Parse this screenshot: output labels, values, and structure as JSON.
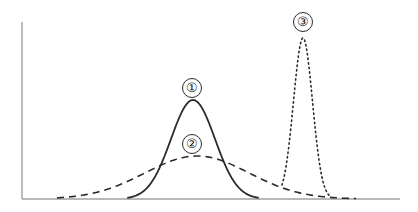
{
  "figure": {
    "name": "three-normal-distribution-curves",
    "background_color": "#ffffff",
    "axis_color": "#a0a0a0",
    "curve_color": "#2b2b2b",
    "axes": {
      "y_axis": {
        "x": 22,
        "y_top": 22,
        "y_bottom": 199
      },
      "x_axis": {
        "y": 199,
        "x_left": 22,
        "x_right": 400
      },
      "x_tick_labels": [],
      "y_tick_labels": [],
      "grid": false
    },
    "labels": [
      {
        "id": "1",
        "text": "①",
        "glyph": "1",
        "cx": 192,
        "cy": 88
      },
      {
        "id": "2",
        "text": "②",
        "glyph": "2",
        "cx": 192,
        "cy": 144
      },
      {
        "id": "3",
        "text": "③",
        "glyph": "3",
        "cx": 303,
        "cy": 22
      }
    ]
  },
  "chart_data": {
    "type": "line",
    "title": "",
    "subtitle": "",
    "xlabel": "",
    "ylabel": "",
    "xlim": [
      22,
      400
    ],
    "ylim": [
      0,
      1
    ],
    "grid": false,
    "legend_position": "inline-annotations",
    "x_tick_labels": [],
    "y_tick_labels": [],
    "series": [
      {
        "name": "1",
        "label": "①",
        "line_style": "solid",
        "color": "#2b2b2b",
        "line_width": 1.8,
        "distribution": "normal",
        "mean_px": 193,
        "sigma_px": 22,
        "peak_px": {
          "x": 193,
          "y": 100
        },
        "peak_height_px": 99,
        "baseline_span_px": [
          128,
          258
        ],
        "annotation": {
          "text": "①",
          "x": 192,
          "y": 88
        }
      },
      {
        "name": "2",
        "label": "②",
        "line_style": "dashed",
        "dash_pattern_px": [
          7,
          5
        ],
        "color": "#2b2b2b",
        "line_width": 1.6,
        "distribution": "normal",
        "mean_px": 197,
        "sigma_px": 52,
        "peak_px": {
          "x": 197,
          "y": 156
        },
        "peak_height_px": 43,
        "baseline_span_px": [
          57,
          356
        ],
        "annotation": {
          "text": "②",
          "x": 192,
          "y": 144
        }
      },
      {
        "name": "3",
        "label": "③",
        "line_style": "dotted",
        "dash_pattern_px": [
          1.4,
          3.2
        ],
        "color": "#2b2b2b",
        "line_width": 1.6,
        "distribution": "normal",
        "mean_px": 303,
        "sigma_px": 9.5,
        "peak_px": {
          "x": 303,
          "y": 38
        },
        "peak_height_px": 161,
        "baseline_span_px": [
          282,
          330
        ],
        "annotation": {
          "text": "③",
          "x": 303,
          "y": 22
        }
      }
    ]
  }
}
